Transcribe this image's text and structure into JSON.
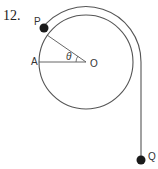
{
  "problem_number": "12.",
  "labels": {
    "P": "P",
    "A": "A",
    "O": "O",
    "Q": "Q",
    "theta": "θ"
  },
  "geometry": {
    "circle_center": [
      86,
      62
    ],
    "circle_radius": 47,
    "string_radius": 55,
    "string_vertical_x": 141,
    "q_position": [
      141,
      160
    ],
    "p_angle_deg": 145
  },
  "colors": {
    "line": "#555555",
    "mass": "#1a1a1a",
    "text": "#333333"
  }
}
